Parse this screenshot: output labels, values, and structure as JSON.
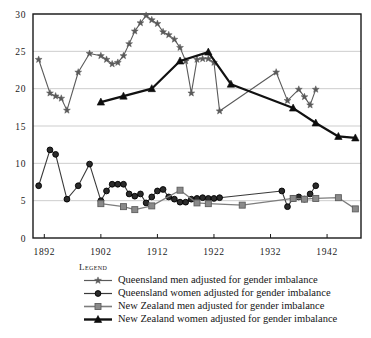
{
  "chart_data": {
    "type": "line",
    "title": "",
    "subtitle": "",
    "xlabel": "",
    "ylabel": "",
    "xlim": [
      1890,
      1948
    ],
    "ylim": [
      0,
      30
    ],
    "grid": true,
    "grid_axis": "y",
    "legend_position": "below-plot-left",
    "legend_title": "Legend",
    "x_ticks": [
      1892,
      1902,
      1912,
      1922,
      1932,
      1942
    ],
    "x_tick_labels": [
      "1892",
      "1902",
      "1912",
      "1922",
      "1932",
      "1942"
    ],
    "y_ticks": [
      0,
      5,
      10,
      15,
      20,
      25,
      30
    ],
    "y_tick_labels": [
      "0",
      "5",
      "10",
      "15",
      "20",
      "25",
      "30"
    ],
    "series": [
      {
        "name": "Queensland men adjusted for gender imbalance",
        "marker": "star",
        "color": "#5a5a5a",
        "line_width": 1.1,
        "x": [
          1891,
          1893,
          1894,
          1895,
          1896,
          1898,
          1900,
          1902,
          1903,
          1904,
          1905,
          1906,
          1907,
          1908,
          1909,
          1910,
          1911,
          1912,
          1913,
          1914,
          1915,
          1916,
          1917,
          1918,
          1919,
          1920,
          1921,
          1922,
          1923,
          1933,
          1935,
          1937,
          1938,
          1939,
          1940
        ],
        "y": [
          23.9,
          19.4,
          19.0,
          18.7,
          17.1,
          22.2,
          24.7,
          24.4,
          23.9,
          23.3,
          23.5,
          24.4,
          26.0,
          27.7,
          28.8,
          29.8,
          29.2,
          28.7,
          27.6,
          27.2,
          26.6,
          25.5,
          23.7,
          19.4,
          23.9,
          24.0,
          24.0,
          23.5,
          17.0,
          22.2,
          18.4,
          19.9,
          18.9,
          17.8,
          19.9
        ]
      },
      {
        "name": "Queensland women adjusted for gender imbalance",
        "marker": "circle",
        "color": "#3a3a3a",
        "line_width": 1.1,
        "x": [
          1891,
          1893,
          1894,
          1896,
          1898,
          1900,
          1902,
          1903,
          1904,
          1905,
          1906,
          1907,
          1908,
          1909,
          1910,
          1911,
          1912,
          1913,
          1914,
          1915,
          1916,
          1917,
          1918,
          1919,
          1920,
          1921,
          1922,
          1923,
          1934,
          1935,
          1936,
          1937,
          1938,
          1939,
          1940
        ],
        "y": [
          7.0,
          11.8,
          11.2,
          5.2,
          7.0,
          9.9,
          5.0,
          6.3,
          7.2,
          7.2,
          7.2,
          5.9,
          5.6,
          5.9,
          4.7,
          5.5,
          6.3,
          6.5,
          5.5,
          5.2,
          4.8,
          4.8,
          5.2,
          5.3,
          5.4,
          5.3,
          5.3,
          5.4,
          6.3,
          4.2,
          5.3,
          5.5,
          5.2,
          5.9,
          7.0
        ]
      },
      {
        "name": "New Zealand men adjusted for gender imbalance",
        "marker": "square",
        "color": "#7d7d7d",
        "line_width": 1.3,
        "x": [
          1902,
          1906,
          1908,
          1911,
          1916,
          1919,
          1921,
          1927,
          1936,
          1938,
          1940,
          1944,
          1947
        ],
        "y": [
          4.6,
          4.2,
          3.8,
          4.3,
          6.4,
          4.7,
          4.6,
          4.4,
          5.3,
          5.2,
          5.3,
          5.4,
          3.9
        ]
      },
      {
        "name": "New Zealand women adjusted for gender imbalance",
        "marker": "triangle",
        "color": "#111111",
        "line_width": 2.2,
        "x": [
          1902,
          1906,
          1911,
          1916,
          1921,
          1925,
          1936,
          1940,
          1944,
          1947
        ],
        "y": [
          18.2,
          19.0,
          20.0,
          23.7,
          24.9,
          20.6,
          17.4,
          15.4,
          13.6,
          13.4
        ]
      }
    ]
  },
  "legend": {
    "title": "Legend",
    "entries": [
      {
        "label": "Queensland men adjusted for gender imbalance",
        "marker": "star",
        "color": "#5a5a5a"
      },
      {
        "label": "Queensland women adjusted for gender imbalance",
        "marker": "circle",
        "color": "#3a3a3a"
      },
      {
        "label": "New Zealand men adjusted for gender imbalance",
        "marker": "square",
        "color": "#7d7d7d"
      },
      {
        "label": "New Zealand women adjusted for gender imbalance",
        "marker": "triangle",
        "color": "#111111"
      }
    ]
  },
  "style": {
    "background": "#ffffff",
    "axis_color": "#1a1a1a",
    "grid_color": "#b8b8b8",
    "text_color": "#1a1a1a"
  }
}
